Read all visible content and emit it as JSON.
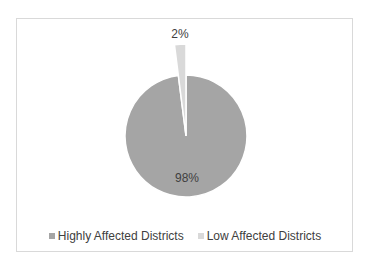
{
  "chart_data": {
    "type": "pie",
    "title": "",
    "categories": [
      "Highly Affected Districts",
      "Low Affected Districts"
    ],
    "values": [
      98,
      2
    ],
    "labels": [
      "98%",
      "2%"
    ],
    "colors": [
      "#a5a5a5",
      "#d9d9d9"
    ],
    "exploded": [
      false,
      true
    ],
    "legend_position": "bottom"
  },
  "legend": {
    "items": [
      {
        "label": "Highly Affected Districts",
        "color": "#a5a5a5"
      },
      {
        "label": "Low Affected Districts",
        "color": "#d9d9d9"
      }
    ]
  }
}
